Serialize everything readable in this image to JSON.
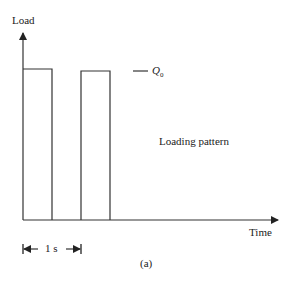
{
  "figure": {
    "y_axis_label": "Load",
    "x_axis_label": "Time",
    "level_label": "Q",
    "level_subscript": "0",
    "annotation": "Loading pattern",
    "period_label": "1 s",
    "caption": "(a)"
  },
  "colors": {
    "line": "#333333",
    "background": "#ffffff"
  }
}
